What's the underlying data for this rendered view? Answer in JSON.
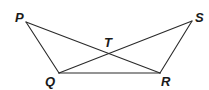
{
  "diagram": {
    "type": "geometry",
    "points": {
      "P": {
        "label": "P",
        "x": 26,
        "y": 22,
        "label_x": 15,
        "label_y": 22
      },
      "S": {
        "label": "S",
        "x": 192,
        "y": 21,
        "label_x": 195,
        "label_y": 22
      },
      "Q": {
        "label": "Q",
        "x": 59,
        "y": 73,
        "label_x": 45,
        "label_y": 86
      },
      "R": {
        "label": "R",
        "x": 160,
        "y": 73,
        "label_x": 161,
        "label_y": 86
      },
      "T": {
        "label": "T",
        "x": 110,
        "y": 54,
        "label_x": 104,
        "label_y": 47
      }
    },
    "segments": [
      {
        "from": "P",
        "to": "Q"
      },
      {
        "from": "P",
        "to": "R"
      },
      {
        "from": "S",
        "to": "Q"
      },
      {
        "from": "S",
        "to": "R"
      },
      {
        "from": "Q",
        "to": "R"
      }
    ],
    "colors": {
      "line": "#2a2a2a",
      "label": "#1a1a1a",
      "background": "#ffffff"
    }
  }
}
